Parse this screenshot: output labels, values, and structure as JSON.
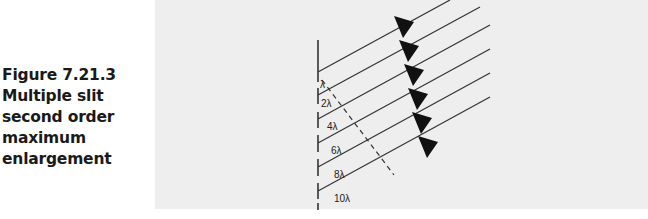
{
  "figure": {
    "number": "Figure 7.21.3",
    "caption_lines": [
      "Multiple slit",
      "second order",
      "maximum",
      "enlargement"
    ]
  },
  "diagram": {
    "path_difference_labels": [
      "λ",
      "2λ",
      "4λ",
      "6λ",
      "8λ",
      "10λ"
    ],
    "ray_count": 6,
    "arrow_direction": "toward barrier",
    "colors": {
      "panel_background": "#eeeeee",
      "line": "#333333",
      "caption_text": "#1a1a1a"
    }
  }
}
